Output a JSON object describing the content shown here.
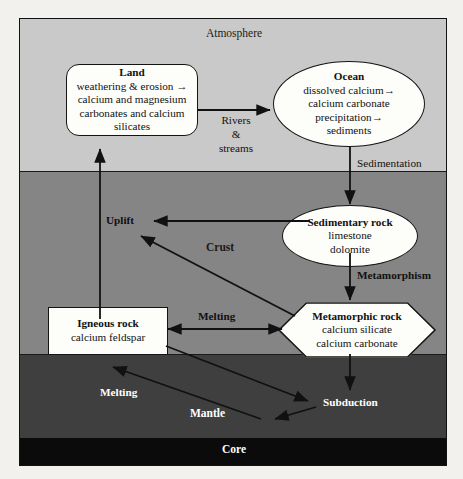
{
  "diagram": {
    "layers": [
      {
        "id": "atmosphere",
        "label": "Atmosphere",
        "color": "#c9c9c9",
        "text_color": "#1a1a1a"
      },
      {
        "id": "crust",
        "label": "Crust",
        "color": "#858585",
        "text_color": "#1a1a1a"
      },
      {
        "id": "mantle",
        "label": "Mantle",
        "color": "#3f3f3f",
        "text_color": "#ffffff"
      },
      {
        "id": "core",
        "label": "Core",
        "color": "#0b0b0b",
        "text_color": "#ffffff"
      }
    ],
    "nodes": [
      {
        "id": "land",
        "shape": "rounded-rectangle",
        "title": "Land",
        "lines": [
          "weathering & erosion →",
          "calcium and magnesium",
          "carbonates and calcium",
          "silicates"
        ]
      },
      {
        "id": "ocean",
        "shape": "ellipse",
        "title": "Ocean",
        "lines": [
          "dissolved calcium→",
          "calcium carbonate",
          "precipitation→",
          "sediments"
        ]
      },
      {
        "id": "sedimentary-rock",
        "shape": "ellipse",
        "title": "Sedimentary rock",
        "lines": [
          "limestone",
          "dolomite"
        ]
      },
      {
        "id": "metamorphic-rock",
        "shape": "hexagon",
        "title": "Metamorphic rock",
        "lines": [
          "calcium silicate",
          "calcium carbonate"
        ]
      },
      {
        "id": "igneous-rock",
        "shape": "rectangle",
        "title": "Igneous rock",
        "lines": [
          "calcium feldspar"
        ]
      }
    ],
    "process_labels": [
      {
        "id": "rivers-streams",
        "lines": [
          "Rivers",
          "&",
          "streams"
        ]
      },
      {
        "id": "sedimentation",
        "text": "Sedimentation"
      },
      {
        "id": "uplift",
        "text": "Uplift"
      },
      {
        "id": "metamorphism",
        "text": "Metamorphism"
      },
      {
        "id": "melting-crust",
        "text": "Melting"
      },
      {
        "id": "melting-mantle",
        "text": "Melting"
      },
      {
        "id": "subduction",
        "text": "Subduction"
      }
    ]
  }
}
